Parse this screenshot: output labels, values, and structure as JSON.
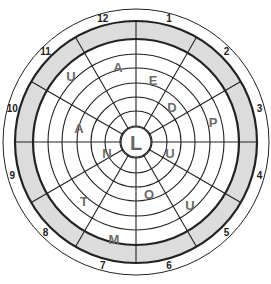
{
  "puzzle": {
    "center": {
      "x": 136,
      "y": 142
    },
    "outer_radius": 133,
    "band_outer_radius": 121,
    "band_inner_radius": 103,
    "ring_radii": [
      88,
      74,
      59,
      45,
      31,
      16
    ],
    "hub_radius": 15,
    "sectors": 12,
    "colors": {
      "band_fill": "#dcdcdc",
      "line": "#222222",
      "letter": "#6b6b6b"
    },
    "center_letter": "L",
    "sector_numbers": [
      "1",
      "2",
      "3",
      "4",
      "5",
      "6",
      "7",
      "8",
      "9",
      "10",
      "11",
      "12"
    ],
    "letters": [
      {
        "char": "A",
        "sector": 12,
        "ring": 2,
        "x": 118,
        "y": 67
      },
      {
        "char": "U",
        "sector": 11,
        "ring": 1,
        "x": 71,
        "y": 76
      },
      {
        "char": "E",
        "sector": 1,
        "ring": 3,
        "x": 153,
        "y": 80
      },
      {
        "char": "D",
        "sector": 2,
        "ring": 4,
        "x": 172,
        "y": 107
      },
      {
        "char": "P",
        "sector": 3,
        "ring": 2,
        "x": 213,
        "y": 122
      },
      {
        "char": "A",
        "sector": 10,
        "ring": 3,
        "x": 79,
        "y": 128
      },
      {
        "char": "N",
        "sector": 9,
        "ring": 5,
        "x": 107,
        "y": 153
      },
      {
        "char": "U",
        "sector": 4,
        "ring": 5,
        "x": 170,
        "y": 153
      },
      {
        "char": "O",
        "sector": 6,
        "ring": 4,
        "x": 149,
        "y": 194
      },
      {
        "char": "U",
        "sector": 5,
        "ring": 2,
        "x": 190,
        "y": 205
      },
      {
        "char": "T",
        "sector": 8,
        "ring": 2,
        "x": 84,
        "y": 201
      },
      {
        "char": "M",
        "sector": 7,
        "ring": 1,
        "x": 114,
        "y": 239
      }
    ]
  }
}
